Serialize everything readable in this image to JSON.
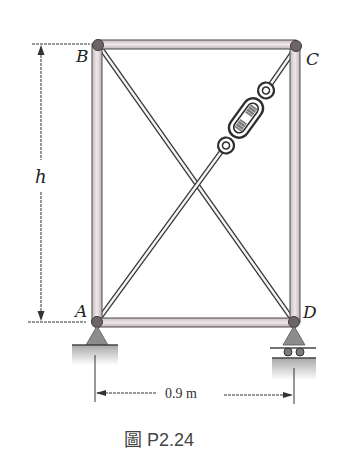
{
  "figure": {
    "caption": "圖 P2.24"
  },
  "joints": {
    "A": "A",
    "B": "B",
    "C": "C",
    "D": "D"
  },
  "dimensions": {
    "height_label": "h",
    "width_label": "0.9 m"
  },
  "members": [
    {
      "name": "AB",
      "type": "bar"
    },
    {
      "name": "BC",
      "type": "bar"
    },
    {
      "name": "CD",
      "type": "bar"
    },
    {
      "name": "AD",
      "type": "bar"
    },
    {
      "name": "BD",
      "type": "cable"
    },
    {
      "name": "AC",
      "type": "cable-with-turnbuckle"
    }
  ],
  "supports": {
    "A": "pin",
    "D": "roller"
  },
  "colors": {
    "bar_fill": "#d9cdd2",
    "bar_stroke": "#4a4a4a",
    "joint": "#6e6468",
    "support": "#8c8c8c",
    "ground_top": "#9a9a9a",
    "line": "#333333"
  }
}
